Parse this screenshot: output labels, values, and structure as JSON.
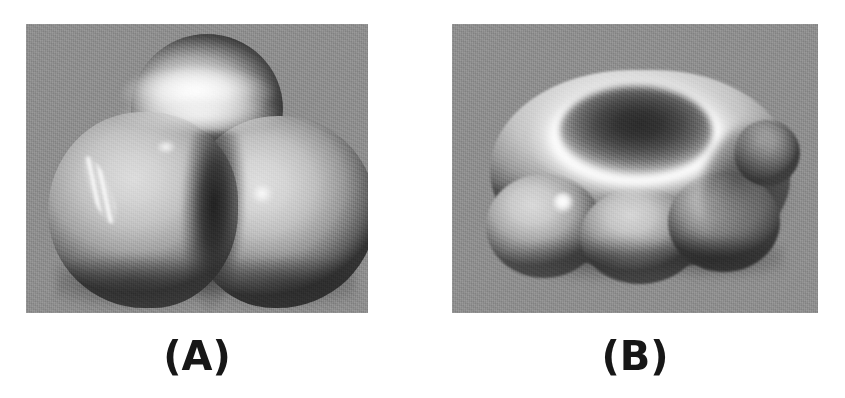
{
  "figure": {
    "background_color": "#ffffff",
    "panel_background_color": "#8e8e8e",
    "rendering": "grayscale 3d shaded isosurface",
    "panels": [
      {
        "id": "A",
        "caption": "(A)",
        "description": "Three-lobed (trefoil) shaded isosurface with one rear upper lobe and two front lobes separated by a deep dark valley",
        "x": 26,
        "y": 24,
        "width": 342,
        "height": 289,
        "features": {
          "lobe_count": 3,
          "highlight_spots": 2,
          "specular_streak": true,
          "valley": "dark V-shaped cleft between the two front lobes"
        }
      },
      {
        "id": "B",
        "caption": "(B)",
        "description": "Crater / torus shaped shaded isosurface with a bright annular rim and a dark central depression, scalloped lower edge",
        "x": 452,
        "y": 24,
        "width": 366,
        "height": 289,
        "features": {
          "lobe_count": 3,
          "highlight_spots": 1,
          "specular_streak": false,
          "crater": "dark elliptical depression ringed by a bright white rim"
        }
      }
    ]
  },
  "captions": {
    "a_label": "(A)",
    "b_label": "(B)"
  }
}
